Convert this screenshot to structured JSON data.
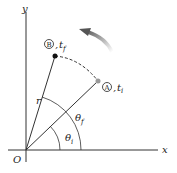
{
  "axes": {
    "x_label": "x",
    "y_label": "y",
    "origin_label": "O"
  },
  "points": [
    {
      "id": "B",
      "marker": "B",
      "time": "t",
      "time_sub": "f"
    },
    {
      "id": "A",
      "marker": "A",
      "time": "t",
      "time_sub": "i"
    }
  ],
  "labels": {
    "radius": "r",
    "theta_f": "θ",
    "theta_f_sub": "f",
    "theta_i": "θ",
    "theta_i_sub": "i",
    "comma": ","
  },
  "colors": {
    "line": "#333333",
    "arrow": "#777777",
    "point_A": "#999999",
    "point_B": "#111111"
  }
}
